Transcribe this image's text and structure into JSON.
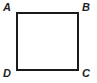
{
  "figure": {
    "type": "geometry-diagram",
    "shape_name": "square",
    "canvas": {
      "width": 97,
      "height": 83,
      "background_color": "#ffffff"
    },
    "shape": {
      "stroke_color": "#1b1b1b",
      "stroke_width": 2,
      "fill_color": "#ffffff",
      "x": 16,
      "y": 12,
      "width": 63,
      "height": 59
    },
    "label_color": "#231f20",
    "vertices": [
      {
        "id": "a",
        "label": "A",
        "position": "top-left"
      },
      {
        "id": "b",
        "label": "B",
        "position": "top-right"
      },
      {
        "id": "c",
        "label": "C",
        "position": "bottom-right"
      },
      {
        "id": "d",
        "label": "D",
        "position": "bottom-left"
      }
    ]
  }
}
